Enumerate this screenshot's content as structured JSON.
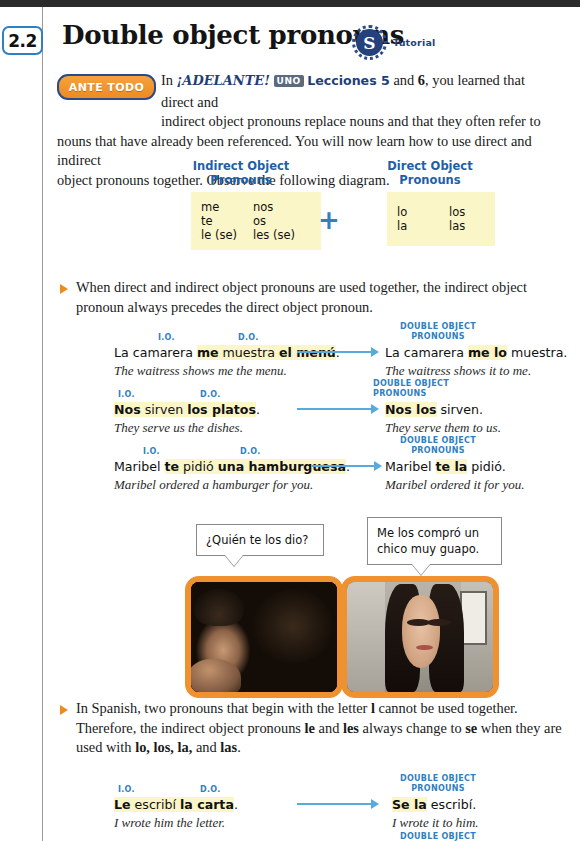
{
  "page": {
    "section_number": "2.2",
    "title": "Double object pronouns",
    "tutorial_icon_letter": "S",
    "tutorial_label": "Tutorial",
    "ante_todo_badge": "ANTE TODO"
  },
  "intro": {
    "line1_pre": "In ",
    "adelante": "¡ADELANTE!",
    "uno": "UNO",
    "lecciones": "Lecciones 5",
    "and": " and ",
    "six": "6",
    "line1_post": ", you learned that direct and",
    "line2": "indirect object pronouns replace nouns and that they often refer to",
    "line3": "nouns that have already been referenced. You will now learn how to use direct and indirect",
    "line4": "object pronouns together. Observe the following diagram."
  },
  "diagram": {
    "indirect": {
      "heading_line1": "Indirect Object",
      "heading_line2": "Pronouns",
      "rows": [
        [
          "me",
          "nos"
        ],
        [
          "te",
          "os"
        ],
        [
          "le (se)",
          "les (se)"
        ]
      ]
    },
    "plus": "+",
    "direct": {
      "heading_line1": "Direct Object",
      "heading_line2": "Pronouns",
      "rows": [
        [
          "lo",
          "los"
        ],
        [
          "la",
          "las"
        ]
      ]
    }
  },
  "rule1": {
    "line1": "When direct and indirect object pronouns are used together, the indirect object",
    "line2": "pronoun always precedes the direct object pronoun."
  },
  "labels": {
    "io": "I.O.",
    "do": "D.O.",
    "double_line1": "DOUBLE OBJECT",
    "double_line2": "PRONOUNS"
  },
  "examples": [
    {
      "left_parts": [
        {
          "text": "La camarera ",
          "bold": false,
          "hl": false
        },
        {
          "text": "me",
          "bold": true,
          "hl": true
        },
        {
          "text": " muestra ",
          "bold": false,
          "hl": true
        },
        {
          "text": "el menú",
          "bold": true,
          "hl": true
        },
        {
          "text": ".",
          "bold": false,
          "hl": false
        }
      ],
      "left_plain": "La camarera me muestra el menú.",
      "left_en": "The waitress shows me the menu.",
      "right_plain": "La camarera me lo muestra.",
      "right_pre": "La camarera ",
      "right_hl": "me lo",
      "right_post": " muestra.",
      "right_en": "The waitress shows it to me."
    },
    {
      "left_plain": "Nos sirven los platos.",
      "left_en": "They serve us the dishes.",
      "right_pre": "",
      "right_hl": "Nos los",
      "right_post": " sirven.",
      "right_plain": "Nos los sirven.",
      "right_en": "They serve them to us."
    },
    {
      "left_plain": "Maribel te pidió una hamburguesa.",
      "left_en": "Maribel ordered a hamburger for you.",
      "right_pre": "Maribel ",
      "right_hl": "te la",
      "right_post": " pidió.",
      "right_plain": "Maribel te la pidió.",
      "right_en": "Maribel ordered it for you."
    }
  ],
  "example_words": {
    "ex1": {
      "a": "La camarera ",
      "io": "me",
      "b": " muestra ",
      "do": "el menú",
      "c": "."
    },
    "ex2": {
      "a": "",
      "io": "Nos",
      "b": " sirven ",
      "do": "los platos",
      "c": "."
    },
    "ex3": {
      "a": "Maribel ",
      "io": "te",
      "b": " pidió ",
      "do": "una hamburguesa",
      "c": "."
    },
    "ex4": {
      "a": "",
      "io": "Le",
      "b": " escribí ",
      "do": "la carta",
      "c": "."
    }
  },
  "photos": {
    "left_bubble": "¿Quién te los dio?",
    "right_bubble_line1": "Me los compró un",
    "right_bubble_line2": "chico muy guapo.",
    "left_alt": "man-photo",
    "right_alt": "woman-photo"
  },
  "rule2": {
    "line1_pre": "In Spanish, two pronouns that begin with the letter ",
    "letter_l": "l",
    "line1_post": " cannot be used together.",
    "line2_pre": "Therefore, the indirect object pronouns ",
    "le": "le",
    "line2_mid": " and ",
    "les": "les",
    "line2_post": " always change to ",
    "se": "se",
    "line2_end": " when they are",
    "line3_pre": "used with ",
    "forms": "lo, los, la,",
    "line3_mid": " and ",
    "las": "las",
    "line3_end": "."
  },
  "example4": {
    "left_plain": "Le escribí la carta.",
    "left_en": "I wrote him the letter.",
    "right_pre": "",
    "right_hl": "Se la",
    "right_post": " escribí.",
    "right_plain": "Se la escribí.",
    "right_en": "I wrote it to him."
  },
  "footer_cut": "DOUBLE OBJECT",
  "colors": {
    "accent_blue": "#2f7fc1",
    "dark_blue": "#24407d",
    "orange": "#ec8b22",
    "frame_orange": "#f0912f",
    "highlight_yellow": "#fbf6c8",
    "table_yellow": "#fbf6c8"
  }
}
